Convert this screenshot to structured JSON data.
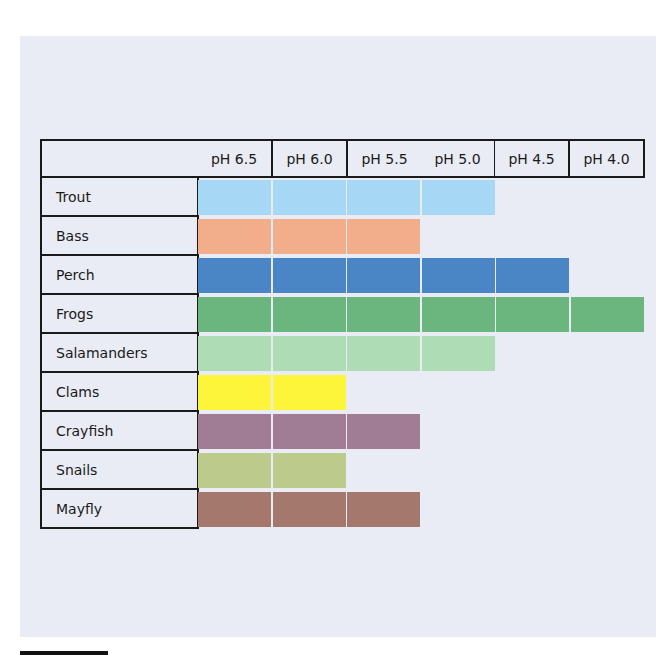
{
  "chart_data": {
    "type": "table",
    "title": "",
    "columns": [
      "pH 6.5",
      "pH 6.0",
      "pH 5.5",
      "pH 5.0",
      "pH 4.5",
      "pH 4.0"
    ],
    "rows": [
      {
        "label": "Trout",
        "cells_filled": 4,
        "color": "#a6d8f5"
      },
      {
        "label": "Bass",
        "cells_filled": 3,
        "color": "#f2ae8a"
      },
      {
        "label": "Perch",
        "cells_filled": 5,
        "color": "#4a86c5"
      },
      {
        "label": "Frogs",
        "cells_filled": 6,
        "color": "#6bb57e"
      },
      {
        "label": "Salamanders",
        "cells_filled": 4,
        "color": "#aedcb5"
      },
      {
        "label": "Clams",
        "cells_filled": 2,
        "color": "#fdf53a"
      },
      {
        "label": "Crayfish",
        "cells_filled": 3,
        "color": "#a07c95"
      },
      {
        "label": "Snails",
        "cells_filled": 2,
        "color": "#bccb8c"
      },
      {
        "label": "Mayfly",
        "cells_filled": 3,
        "color": "#a5786d"
      }
    ],
    "meaning": "Colored cells indicate the pH levels at which each organism can survive"
  },
  "colors": {
    "panel_bg": "#e9ecf4",
    "border": "#1a1a1a",
    "cell_gap": "#ffffff"
  }
}
